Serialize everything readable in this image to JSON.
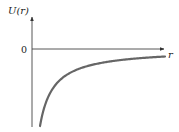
{
  "figure": {
    "y_axis_label": "U(r)",
    "x_axis_label": "r",
    "zero_label": "0",
    "curve_color": "#666666",
    "axis_color": "#333333"
  },
  "chart_data": {
    "type": "line",
    "title": "",
    "xlabel": "r",
    "ylabel": "U(r)",
    "y_ticks": [
      "0"
    ],
    "series": [
      {
        "name": "U(r)",
        "function": "-k/r",
        "points_pixel": [
          [
            40,
            126
          ],
          [
            45,
            105
          ],
          [
            50,
            93
          ],
          [
            60,
            80
          ],
          [
            75,
            70
          ],
          [
            100,
            63
          ],
          [
            130,
            58
          ],
          [
            165,
            56
          ]
        ]
      }
    ]
  }
}
